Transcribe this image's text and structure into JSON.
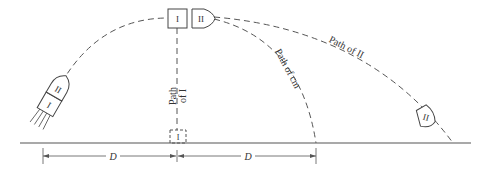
{
  "diagram": {
    "fragment_labels": {
      "piece_one": "I",
      "piece_two": "II"
    },
    "path_labels": {
      "path_of_one_line1": "Path",
      "path_of_one_line2": "of I",
      "path_of_cm": "Path of cm",
      "path_of_two": "Path of II"
    },
    "dimensions": {
      "left_distance": "D",
      "right_distance": "D"
    }
  }
}
